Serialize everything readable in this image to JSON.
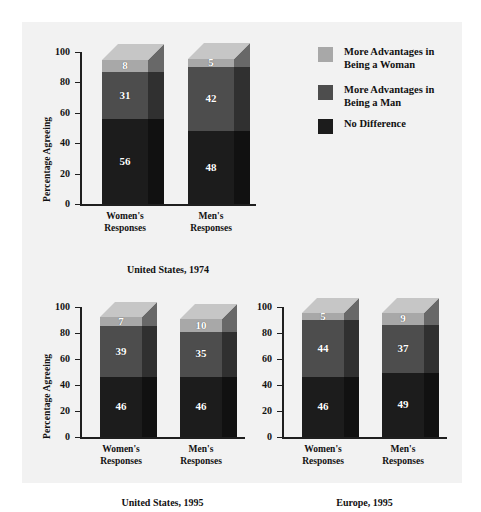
{
  "figure": {
    "background": "#ffffff",
    "panel_background": "#f2f2f2"
  },
  "legend": {
    "items": [
      {
        "label": "More Advantages in\nBeing a Woman",
        "color": "#a8a8a8",
        "name": "legend-more-advantages-woman"
      },
      {
        "label": "More Advantages in\nBeing a Man",
        "color": "#4d4d4d",
        "name": "legend-more-advantages-man"
      },
      {
        "label": "No Difference",
        "color": "#1c1c1c",
        "name": "legend-no-difference"
      }
    ]
  },
  "chart_data": [
    {
      "type": "bar",
      "id": "united-states-1974",
      "title": "United States, 1974",
      "xlabel": "",
      "ylabel": "Percentage Agreeing",
      "ylim": [
        0,
        100
      ],
      "yticks": [
        "0",
        "20",
        "40",
        "60",
        "80",
        "100"
      ],
      "grid": false,
      "stacked": true,
      "legend_position": "right",
      "categories": [
        "Women's\nResponses",
        "Men's\nResponses"
      ],
      "series": [
        {
          "name": "No Difference",
          "color": "#1c1c1c",
          "values": [
            56,
            48
          ]
        },
        {
          "name": "More Advantages in Being a Man",
          "color": "#4d4d4d",
          "values": [
            31,
            42
          ]
        },
        {
          "name": "More Advantages in Being a Woman",
          "color": "#a8a8a8",
          "values": [
            8,
            5
          ]
        }
      ]
    },
    {
      "type": "bar",
      "id": "united-states-1995",
      "title": "United States, 1995",
      "xlabel": "",
      "ylabel": "Percentage Agreeing",
      "ylim": [
        0,
        100
      ],
      "yticks": [
        "0",
        "20",
        "40",
        "60",
        "80",
        "100"
      ],
      "grid": false,
      "stacked": true,
      "categories": [
        "Women's\nResponses",
        "Men's\nResponses"
      ],
      "series": [
        {
          "name": "No Difference",
          "color": "#1c1c1c",
          "values": [
            46,
            46
          ]
        },
        {
          "name": "More Advantages in Being a Man",
          "color": "#4d4d4d",
          "values": [
            39,
            35
          ]
        },
        {
          "name": "More Advantages in Being a Woman",
          "color": "#a8a8a8",
          "values": [
            7,
            10
          ]
        }
      ]
    },
    {
      "type": "bar",
      "id": "europe-1995",
      "title": "Europe, 1995",
      "xlabel": "",
      "ylabel": "",
      "ylim": [
        0,
        100
      ],
      "yticks": [
        "0",
        "20",
        "40",
        "60",
        "80",
        "100"
      ],
      "grid": false,
      "stacked": true,
      "categories": [
        "Women's\nResponses",
        "Men's\nResponses"
      ],
      "series": [
        {
          "name": "No Difference",
          "color": "#1c1c1c",
          "values": [
            46,
            49
          ]
        },
        {
          "name": "More Advantages in Being a Man",
          "color": "#4d4d4d",
          "values": [
            44,
            37
          ]
        },
        {
          "name": "More Advantages in Being a Woman",
          "color": "#a8a8a8",
          "values": [
            5,
            9
          ]
        }
      ]
    }
  ]
}
